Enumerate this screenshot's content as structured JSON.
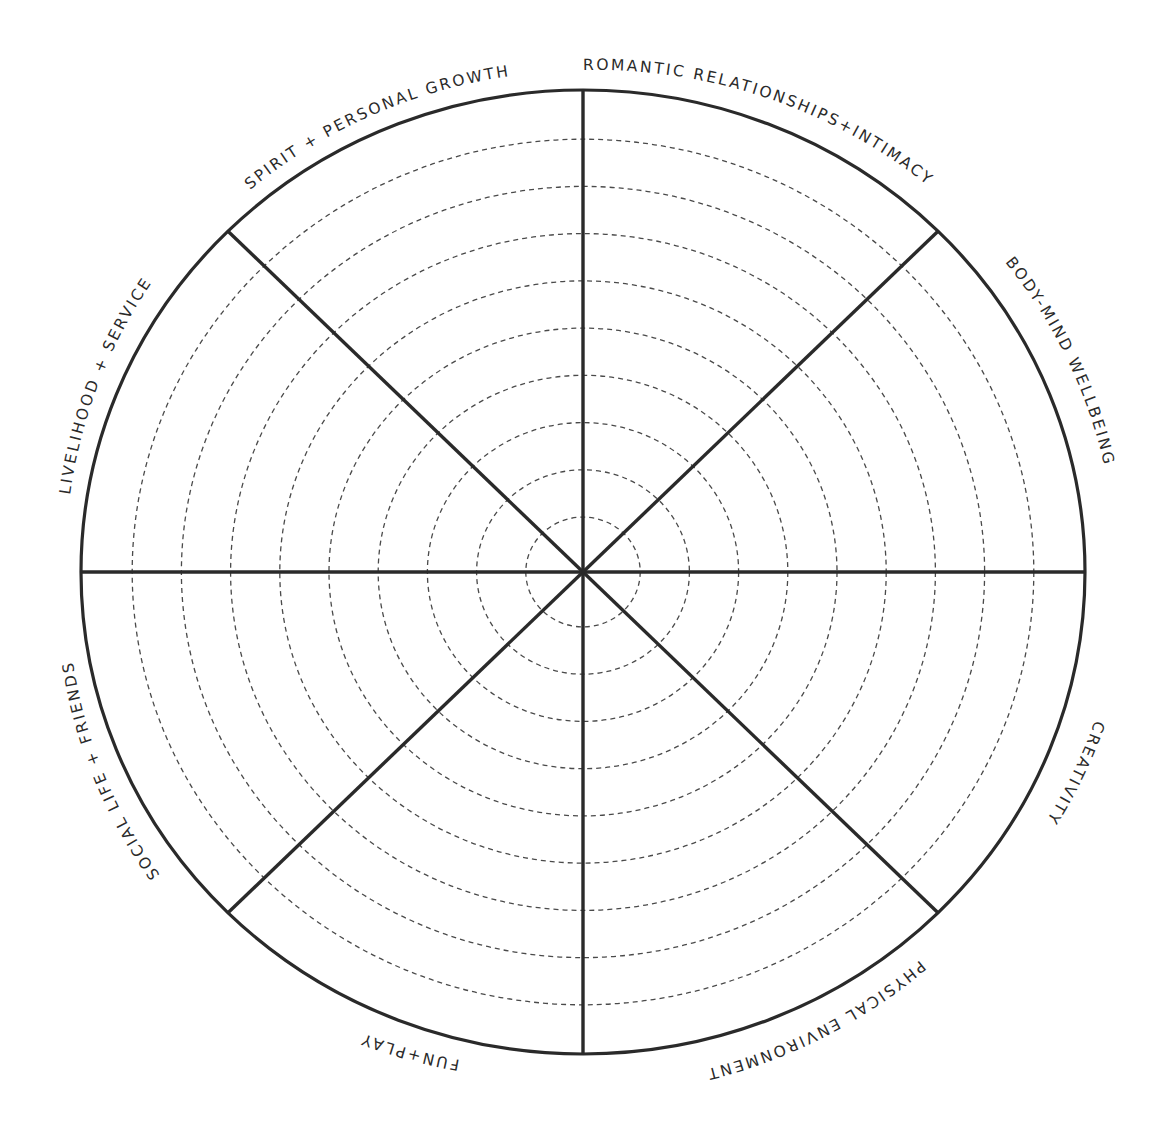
{
  "diagram": {
    "type": "wheel-of-life",
    "center": {
      "x": 583,
      "y": 572
    },
    "outer_radius_x": 502,
    "outer_radius_y": 482,
    "ring_count": 9,
    "ring_radii_fraction": [
      0.114,
      0.212,
      0.31,
      0.408,
      0.506,
      0.604,
      0.702,
      0.8,
      0.898
    ],
    "stroke_color": "#2a2a2a",
    "ring_color": "#4a4a4a",
    "segments": [
      {
        "label": "ROMANTIC RELATIONSHIPS+INTIMACY",
        "position": "top-right"
      },
      {
        "label": "BODY-MIND WELLBEING",
        "position": "right-upper"
      },
      {
        "label": "CREATIVITY",
        "position": "right-lower"
      },
      {
        "label": "PHYSICAL ENVIRONMENT",
        "position": "bottom-right"
      },
      {
        "label": "FUN+PLAY",
        "position": "bottom-left"
      },
      {
        "label": "SOCIAL LIFE + FRIENDS",
        "position": "left-lower"
      },
      {
        "label": "LIVELIHOOD + SERVICE",
        "position": "left-upper"
      },
      {
        "label": "SPIRIT + PERSONAL GROWTH",
        "position": "top-left"
      }
    ]
  }
}
